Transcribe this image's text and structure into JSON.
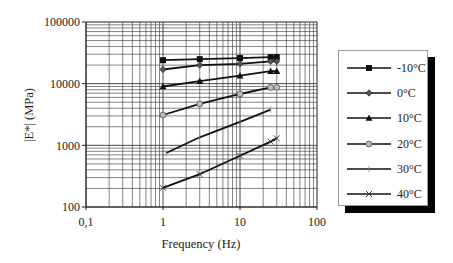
{
  "chart_data": {
    "type": "line",
    "title": "",
    "xlabel": "Frequency (Hz)",
    "ylabel": "|E*| (MPa)",
    "xscale": "log",
    "yscale": "log",
    "xlim": [
      0.1,
      100
    ],
    "ylim": [
      100,
      100000
    ],
    "grid": true,
    "legend_position": "right",
    "x_tick_labels": [
      "0,1",
      "1",
      "10",
      "100"
    ],
    "y_tick_labels": [
      "100",
      "1000",
      "10000",
      "100000"
    ],
    "series": [
      {
        "name": "-10°C",
        "marker": "square",
        "x": [
          1,
          3,
          10,
          25,
          30
        ],
        "values": [
          24000,
          25000,
          26000,
          27000,
          27000
        ]
      },
      {
        "name": "0°C",
        "marker": "diamond",
        "x": [
          1,
          3,
          10,
          25,
          30
        ],
        "values": [
          17000,
          20000,
          21000,
          23000,
          23000
        ]
      },
      {
        "name": "10°C",
        "marker": "triangle",
        "x": [
          1,
          3,
          10,
          25,
          30
        ],
        "values": [
          9000,
          11000,
          13500,
          16000,
          16000
        ]
      },
      {
        "name": "20°C",
        "marker": "circle",
        "x": [
          1,
          3,
          10,
          25,
          30
        ],
        "values": [
          3100,
          4700,
          6800,
          8700,
          8700
        ]
      },
      {
        "name": "30°C",
        "marker": "plus",
        "x": [
          1.1,
          3,
          10,
          25
        ],
        "values": [
          750,
          1350,
          2400,
          3800
        ]
      },
      {
        "name": "40°C",
        "marker": "x",
        "x": [
          1,
          3,
          10,
          25,
          30
        ],
        "values": [
          205,
          340,
          680,
          1150,
          1300
        ]
      }
    ]
  },
  "axes": {
    "x_title": "Frequency (Hz)",
    "y_title": "|E*| (MPa)",
    "x_ticks": [
      "0,1",
      "1",
      "10",
      "100"
    ],
    "y_ticks": [
      "100000",
      "10000",
      "1000",
      "100"
    ]
  },
  "legend": {
    "items": [
      {
        "label": "-10°C",
        "marker": "square"
      },
      {
        "label": "0°C",
        "marker": "diamond"
      },
      {
        "label": "10°C",
        "marker": "triangle"
      },
      {
        "label": "20°C",
        "marker": "circle"
      },
      {
        "label": "30°C",
        "marker": "plus"
      },
      {
        "label": "40°C",
        "marker": "x"
      }
    ]
  },
  "colors": {
    "line": "#111111",
    "grid": "#333333",
    "background": "#ffffff",
    "legend_shadow": "#000000"
  }
}
